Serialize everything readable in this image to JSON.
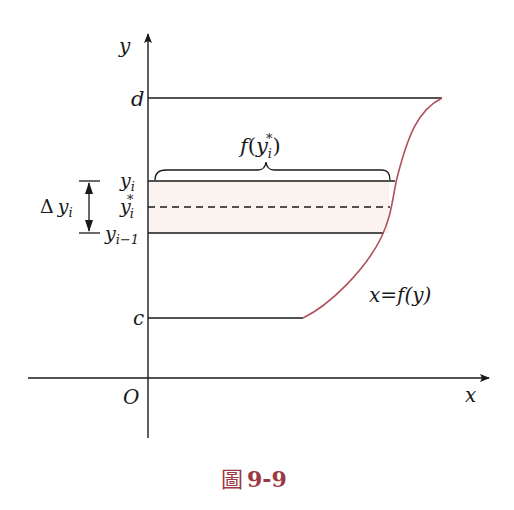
{
  "figure": {
    "caption_char": "圖",
    "caption_number": "9-9",
    "caption_color": "#9b3a44"
  },
  "axes": {
    "x_label": "x",
    "y_label": "y",
    "origin_label": "O"
  },
  "levels": {
    "d": "d",
    "c": "c",
    "y_i": "y",
    "y_i_sub": "i",
    "y_star": "y",
    "y_star_sub": "i",
    "y_star_sup": "*",
    "y_prev": "y",
    "y_prev_sub": "i−1"
  },
  "annotations": {
    "delta_symbol": "Δ",
    "delta_var": "y",
    "delta_sub": "i",
    "brace_label_f": "f",
    "brace_label_open": "(",
    "brace_label_var": "y",
    "brace_label_sub": "i",
    "brace_label_sup": "*",
    "brace_label_close": ")",
    "curve_label": "x=f(y)"
  },
  "colors": {
    "curve": "#b0505a",
    "strip_fill": "#faf3f0",
    "line": "#1a1a1a"
  }
}
